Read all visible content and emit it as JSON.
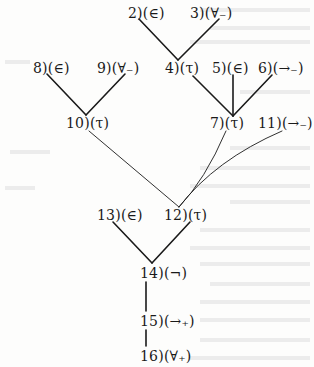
{
  "diagram": {
    "type": "proof-tree",
    "nodes": [
      {
        "id": "2",
        "label": "2)",
        "rule": "(∈)",
        "x": 128,
        "y": 5
      },
      {
        "id": "3",
        "label": "3)",
        "rule": "(∀₋)",
        "x": 190,
        "y": 5
      },
      {
        "id": "4",
        "label": "4)",
        "rule": "(τ)",
        "x": 165,
        "y": 60
      },
      {
        "id": "5",
        "label": "5)",
        "rule": "(∈)",
        "x": 212,
        "y": 60
      },
      {
        "id": "6",
        "label": "6)",
        "rule": "(→₋)",
        "x": 258,
        "y": 60
      },
      {
        "id": "8",
        "label": "8)",
        "rule": "(∈)",
        "x": 33,
        "y": 60
      },
      {
        "id": "9",
        "label": "9)",
        "rule": "(∀₋)",
        "x": 97,
        "y": 60
      },
      {
        "id": "10",
        "label": "10)",
        "rule": "(τ)",
        "x": 66,
        "y": 115
      },
      {
        "id": "7",
        "label": "7)",
        "rule": "(τ)",
        "x": 210,
        "y": 115
      },
      {
        "id": "11",
        "label": "11)",
        "rule": "(→₋)",
        "x": 258,
        "y": 115
      },
      {
        "id": "13",
        "label": "13)",
        "rule": "(∈)",
        "x": 97,
        "y": 207
      },
      {
        "id": "12",
        "label": "12)",
        "rule": "(τ)",
        "x": 164,
        "y": 207
      },
      {
        "id": "14",
        "label": "14)",
        "rule": "(¬)",
        "x": 140,
        "y": 265
      },
      {
        "id": "15",
        "label": "15)",
        "rule": "(→₊)",
        "x": 140,
        "y": 313
      },
      {
        "id": "16",
        "label": "16)",
        "rule": "(∀₊)",
        "x": 140,
        "y": 348
      }
    ],
    "edges": [
      {
        "from": "2",
        "to": "4"
      },
      {
        "from": "3",
        "to": "4"
      },
      {
        "from": "8",
        "to": "10"
      },
      {
        "from": "9",
        "to": "10"
      },
      {
        "from": "4",
        "to": "7"
      },
      {
        "from": "5",
        "to": "7"
      },
      {
        "from": "6",
        "to": "7"
      },
      {
        "from": "10",
        "to": "12"
      },
      {
        "from": "7",
        "to": "12"
      },
      {
        "from": "11",
        "to": "12"
      },
      {
        "from": "13",
        "to": "14"
      },
      {
        "from": "12",
        "to": "14"
      },
      {
        "from": "14",
        "to": "15"
      },
      {
        "from": "15",
        "to": "16"
      }
    ]
  }
}
